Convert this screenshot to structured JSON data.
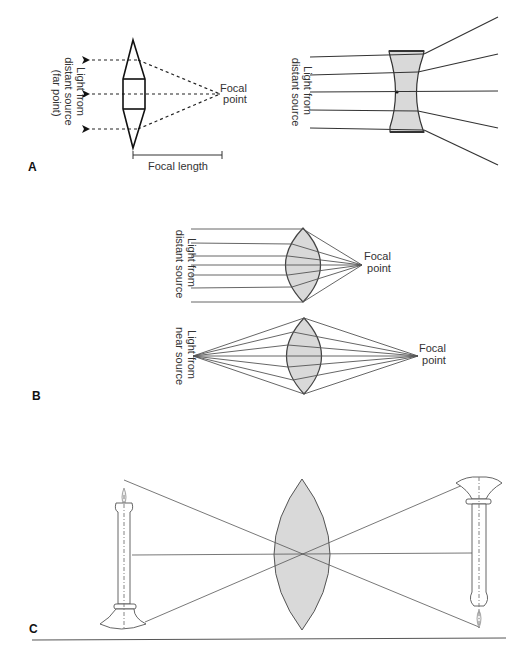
{
  "figure": {
    "panels": [
      {
        "id": "A",
        "label": "A",
        "left_diagram": {
          "source_label_line1": "Light from",
          "source_label_line2": "distant source",
          "source_label_line3": "(far point)",
          "focal_point_line1": "Focal",
          "focal_point_line2": "point",
          "focal_length_label": "Focal length"
        },
        "right_diagram": {
          "source_label_line1": "Light from",
          "source_label_line2": "distant source"
        }
      },
      {
        "id": "B",
        "label": "B",
        "top_diagram": {
          "source_label_line1": "Light from",
          "source_label_line2": "distant source",
          "focal_point_line1": "Focal",
          "focal_point_line2": "point"
        },
        "bottom_diagram": {
          "source_label_line1": "Light from",
          "source_label_line2": "near source",
          "focal_point_line1": "Focal",
          "focal_point_line2": "point"
        }
      },
      {
        "id": "C",
        "label": "C"
      }
    ],
    "colors": {
      "lens_fill": "#d9d9d9",
      "line": "#444444",
      "text": "#333333"
    }
  }
}
